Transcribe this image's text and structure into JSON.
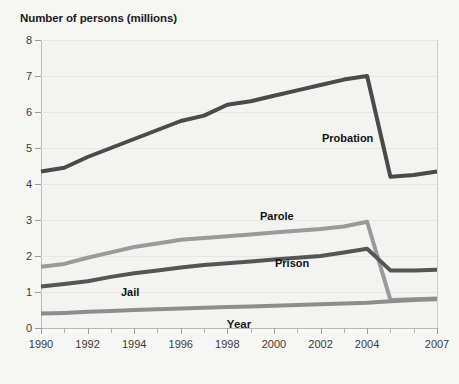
{
  "chart_data": {
    "type": "line",
    "title": "",
    "ylabel": "Number of persons (millions)",
    "xlabel": "Year",
    "ylim": [
      0,
      8
    ],
    "xlim": [
      1990,
      2007
    ],
    "yticks": [
      0,
      1,
      2,
      3,
      4,
      5,
      6,
      7,
      8
    ],
    "ytick_labels": [
      "0",
      "1",
      "2",
      "3",
      "4",
      "5",
      "6",
      "7",
      "8"
    ],
    "xticks": [
      1990,
      1991,
      1992,
      1993,
      1994,
      1995,
      1996,
      1997,
      1998,
      1999,
      2000,
      2001,
      2002,
      2003,
      2004,
      2005,
      2006,
      2007
    ],
    "xtick_labels": [
      "1990",
      "",
      "1992",
      "",
      "1994",
      "",
      "1996",
      "",
      "1998",
      "",
      "2000",
      "",
      "2002",
      "",
      "2004",
      "",
      "",
      "2007"
    ],
    "grid": true,
    "legend_position": "inline-annotations",
    "x": [
      1990,
      1991,
      1992,
      1993,
      1994,
      1995,
      1996,
      1997,
      1998,
      1999,
      2000,
      2001,
      2002,
      2003,
      2004,
      2005,
      2006,
      2007
    ],
    "series": [
      {
        "name": "Probation",
        "color": "#4a4a4a",
        "values": [
          4.35,
          4.45,
          4.75,
          5.0,
          5.25,
          5.5,
          5.75,
          5.9,
          6.2,
          6.3,
          6.45,
          6.6,
          6.75,
          6.9,
          7.0,
          4.2,
          4.25,
          4.35
        ]
      },
      {
        "name": "Parole",
        "color": "#9a9a9a",
        "values": [
          1.7,
          1.78,
          1.95,
          2.1,
          2.25,
          2.35,
          2.45,
          2.5,
          2.55,
          2.6,
          2.65,
          2.7,
          2.75,
          2.82,
          2.95,
          0.78,
          0.8,
          0.82
        ]
      },
      {
        "name": "Prison",
        "color": "#555555",
        "values": [
          1.15,
          1.22,
          1.3,
          1.42,
          1.52,
          1.6,
          1.68,
          1.75,
          1.8,
          1.85,
          1.9,
          1.95,
          2.0,
          2.1,
          2.2,
          1.6,
          1.6,
          1.62
        ]
      },
      {
        "name": "Jail",
        "color": "#8d8d8d",
        "values": [
          0.4,
          0.42,
          0.45,
          0.47,
          0.5,
          0.52,
          0.54,
          0.56,
          0.58,
          0.6,
          0.62,
          0.64,
          0.66,
          0.68,
          0.7,
          0.74,
          0.78,
          0.8
        ]
      }
    ],
    "annotations": [
      {
        "text": "Probation",
        "x_px": 322,
        "y_px": 132
      },
      {
        "text": "Parole",
        "x_px": 260,
        "y_px": 210
      },
      {
        "text": "Prison",
        "x_px": 275,
        "y_px": 257
      },
      {
        "text": "Jail",
        "x_px": 121,
        "y_px": 286
      }
    ]
  }
}
